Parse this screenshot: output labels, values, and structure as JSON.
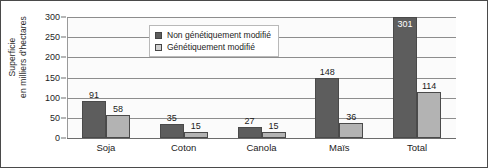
{
  "chart_data": {
    "type": "bar",
    "title": "",
    "subtitle": "",
    "xlabel": "",
    "ylabel": "Superficie en milliers d'hectares",
    "ylabel_lines": [
      "Superficie",
      "en milliers d'hectares"
    ],
    "categories": [
      "Soja",
      "Coton",
      "Canola",
      "Maïs",
      "Total"
    ],
    "series": [
      {
        "name": "Non génétiquement modifié",
        "color": "#5d5d5d",
        "values": [
          91,
          35,
          27,
          148,
          301
        ]
      },
      {
        "name": "Génétiquement modifié",
        "color": "#b3b3b3",
        "values": [
          58,
          15,
          15,
          36,
          114
        ]
      }
    ],
    "ylim": [
      0,
      300
    ],
    "yticks": [
      0,
      50,
      100,
      150,
      200,
      250,
      300
    ],
    "ytick_labels": [
      "0",
      "50",
      "100",
      "150",
      "200",
      "250",
      "300"
    ],
    "grid": true,
    "legend_position": "top-center",
    "data_labels": true
  },
  "legend": {
    "items": [
      {
        "label": "Non génétiquement modifié"
      },
      {
        "label": "Génétiquement modifié"
      }
    ]
  }
}
